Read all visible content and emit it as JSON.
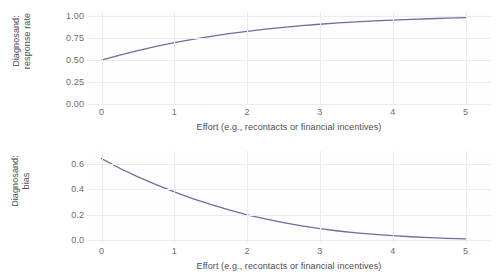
{
  "figure": {
    "background_color": "#ffffff",
    "line_color": "#6d6d9e",
    "grid_color": "#ececed",
    "tick_text_color": "#6b6b6b",
    "axis_title_color": "#4d4d4d"
  },
  "chart_data": [
    {
      "type": "line",
      "panel": "top",
      "title": "",
      "xlabel": "Effort (e.g., recontacts or financial incentives)",
      "ylabel": "Diagnosand:\nresponse rate",
      "ylabel_line1": "Diagnosand:",
      "ylabel_line2": "response rate",
      "xlim": [
        -0.2,
        5.35
      ],
      "ylim": [
        0.0,
        1.05
      ],
      "xticks": [
        0,
        1,
        2,
        3,
        4,
        5
      ],
      "xticklabels": [
        "0",
        "1",
        "2",
        "3",
        "4",
        "5"
      ],
      "yticks": [
        0.0,
        0.25,
        0.5,
        0.75,
        1.0
      ],
      "yticklabels": [
        "0.00",
        "0.25",
        "0.50",
        "0.75",
        "1.00"
      ],
      "grid": true,
      "grid_axis": "both",
      "legend": false,
      "series": [
        {
          "name": "response rate",
          "color": "#6d6d9e",
          "x": [
            0.0,
            0.25,
            0.5,
            0.75,
            1.0,
            1.25,
            1.5,
            1.75,
            2.0,
            2.25,
            2.5,
            2.75,
            3.0,
            3.25,
            3.5,
            3.75,
            4.0,
            4.25,
            4.5,
            4.75,
            5.0
          ],
          "y": [
            0.5,
            0.558,
            0.61,
            0.658,
            0.7,
            0.738,
            0.772,
            0.803,
            0.83,
            0.854,
            0.875,
            0.894,
            0.91,
            0.925,
            0.937,
            0.948,
            0.958,
            0.966,
            0.973,
            0.979,
            0.985
          ]
        }
      ]
    },
    {
      "type": "line",
      "panel": "bottom",
      "title": "",
      "xlabel": "Effort (e.g., recontacts or financial incentives)",
      "ylabel": "Diagnosand:\nbias",
      "ylabel_line1": "Diagnosand:",
      "ylabel_line2": "bias",
      "xlim": [
        -0.2,
        5.35
      ],
      "ylim": [
        -0.02,
        0.7
      ],
      "xticks": [
        0,
        1,
        2,
        3,
        4,
        5
      ],
      "xticklabels": [
        "0",
        "1",
        "2",
        "3",
        "4",
        "5"
      ],
      "yticks": [
        0.0,
        0.2,
        0.4,
        0.6
      ],
      "yticklabels": [
        "0.0",
        "0.2",
        "0.4",
        "0.6"
      ],
      "grid": true,
      "grid_axis": "both",
      "legend": false,
      "series": [
        {
          "name": "bias",
          "color": "#6d6d9e",
          "x": [
            0.0,
            0.25,
            0.5,
            0.75,
            1.0,
            1.25,
            1.5,
            1.75,
            2.0,
            2.25,
            2.5,
            2.75,
            3.0,
            3.25,
            3.5,
            3.75,
            4.0,
            4.25,
            4.5,
            4.75,
            5.0
          ],
          "y": [
            0.64,
            0.565,
            0.497,
            0.437,
            0.38,
            0.328,
            0.282,
            0.24,
            0.2,
            0.168,
            0.139,
            0.114,
            0.092,
            0.074,
            0.059,
            0.047,
            0.037,
            0.029,
            0.022,
            0.016,
            0.012
          ]
        }
      ]
    }
  ]
}
